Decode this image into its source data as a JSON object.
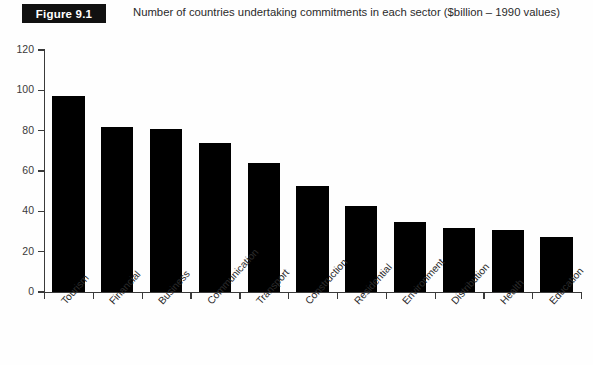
{
  "figure": {
    "badge_label": "Figure 9.1",
    "caption": "Number of countries undertaking commitments in each sector ($billion – 1990 values)"
  },
  "chart_data": {
    "type": "bar",
    "title": "Number of countries undertaking commitments in each sector ($billion – 1990 values)",
    "xlabel": "",
    "ylabel": "",
    "ylim": [
      0,
      120
    ],
    "ytick_labels": [
      "0",
      "20",
      "40",
      "60",
      "80",
      "100",
      "120"
    ],
    "yticks": [
      0,
      20,
      40,
      60,
      80,
      100,
      120
    ],
    "grid": false,
    "legend": false,
    "bar_color": "#000000",
    "categories": [
      "Tourism",
      "Financial",
      "Business",
      "Communication",
      "Transport",
      "Construction",
      "Residential",
      "Environment",
      "Distribution",
      "Health",
      "Education"
    ],
    "values": [
      97,
      82,
      81,
      74,
      64,
      52.5,
      42.5,
      34.5,
      31.5,
      30.5,
      27.5
    ]
  }
}
